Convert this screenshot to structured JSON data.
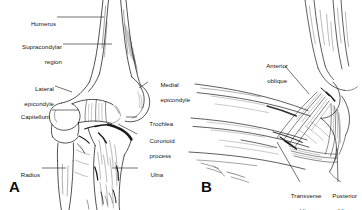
{
  "figure": {
    "type": "anatomical-illustration",
    "style": "black-and-white pen-and-ink line drawing",
    "background_color": "#ffffff",
    "ink_color": "#1a1a1a",
    "label_color": "#131313"
  },
  "panels": [
    {
      "id": "A",
      "letter": "A",
      "view": "anterior view of distal humerus, radius and ulna",
      "labels": [
        {
          "id": "humerus",
          "text": "Humerus",
          "line1": "Humerus",
          "line2": "",
          "side": "left"
        },
        {
          "id": "supracondylar",
          "text": "Supracondylar region",
          "line1": "Supracondylar",
          "line2": "region",
          "side": "left"
        },
        {
          "id": "lateral-epicondyle",
          "text": "Lateral epicondyle",
          "line1": "Lateral",
          "line2": "epicondyle",
          "side": "left"
        },
        {
          "id": "capitellum",
          "text": "Capitellum",
          "line1": "Capitellum",
          "line2": "",
          "side": "left"
        },
        {
          "id": "radius",
          "text": "Radius",
          "line1": "Radius",
          "line2": "",
          "side": "left"
        },
        {
          "id": "medial-epicondyle",
          "text": "Medial epicondyle",
          "line1": "Medial",
          "line2": "epicondyle",
          "side": "right"
        },
        {
          "id": "trochlea",
          "text": "Trochlea",
          "line1": "Trochlea",
          "line2": "",
          "side": "right"
        },
        {
          "id": "coronoid-process",
          "text": "Coronoid process",
          "line1": "Coronoid",
          "line2": "process",
          "side": "right"
        },
        {
          "id": "ulna",
          "text": "Ulna",
          "line1": "Ulna",
          "line2": "",
          "side": "right"
        }
      ]
    },
    {
      "id": "B",
      "letter": "B",
      "view": "medial view showing collateral ligament bundles",
      "labels": [
        {
          "id": "anterior-oblique",
          "text": "Anterior oblique",
          "line1": "Anterior",
          "line2": "oblique",
          "side": "above"
        },
        {
          "id": "transverse-oblique",
          "text": "Transverse oblique",
          "line1": "Transverse",
          "line2": "oblique",
          "side": "below"
        },
        {
          "id": "posterior-oblique",
          "text": "Posterior oblique",
          "line1": "Posterior",
          "line2": "oblique",
          "side": "below"
        }
      ]
    }
  ]
}
